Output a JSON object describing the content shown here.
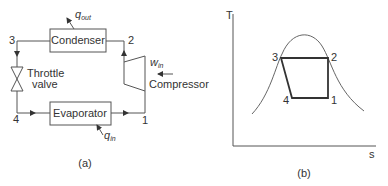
{
  "figure_a": {
    "caption": "(a)",
    "components": {
      "condenser": "Condenser",
      "evaporator": "Evaporator",
      "throttle_line1": "Throttle",
      "throttle_line2": "valve",
      "compressor": "Compressor"
    },
    "states": {
      "s1": "1",
      "s2": "2",
      "s3": "3",
      "s4": "4"
    },
    "heat_work": {
      "q_out_main": "q",
      "q_out_sub": "out",
      "q_in_main": "q",
      "q_in_sub": "in",
      "w_in_main": "w",
      "w_in_sub": "in"
    }
  },
  "figure_b": {
    "caption": "(b)",
    "y_axis": "T",
    "x_axis": "s",
    "states": {
      "s1": "1",
      "s2": "2",
      "s3": "3",
      "s4": "4"
    }
  }
}
